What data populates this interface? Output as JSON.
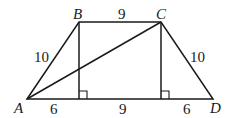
{
  "figure": {
    "type": "isosceles-trapezoid",
    "vertices": {
      "A": {
        "label": "A",
        "x": 27,
        "y": 99
      },
      "B": {
        "label": "B",
        "x": 79,
        "y": 22
      },
      "C": {
        "label": "C",
        "x": 161,
        "y": 22
      },
      "D": {
        "label": "D",
        "x": 213,
        "y": 99
      }
    },
    "segment_labels": {
      "AB": "10",
      "BC": "9",
      "CD": "10",
      "A_footB": "6",
      "footB_footC": "9",
      "footC_D": "6"
    },
    "diagonal": "AC",
    "altitudes": [
      "B",
      "C"
    ],
    "right_angle_marks": 2
  }
}
